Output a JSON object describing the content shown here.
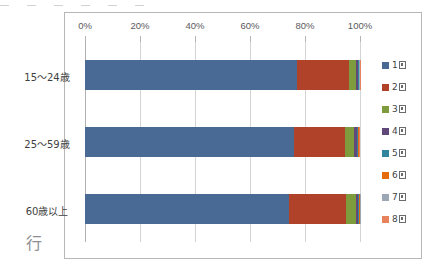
{
  "top_strip": {
    "fragments": [
      "",
      "",
      "",
      "",
      "",
      ""
    ]
  },
  "row_header_glyph": "行",
  "chart_data": {
    "type": "bar",
    "orientation": "horizontal",
    "stacked": "percent",
    "title": "",
    "xlabel": "",
    "ylabel": "",
    "xlim": [
      0,
      100
    ],
    "grid": true,
    "legend_position": "right",
    "tick_labels": [
      "0%",
      "20%",
      "40%",
      "60%",
      "80%",
      "100%"
    ],
    "tick_values": [
      0,
      20,
      40,
      60,
      80,
      100
    ],
    "categories": [
      "15〜24歳",
      "25〜59歳",
      "60歳以上"
    ],
    "series": [
      {
        "name": "1回",
        "color": "#4A6A96",
        "values": [
          77.0,
          76.0,
          74.0
        ]
      },
      {
        "name": "2回",
        "color": "#B0422A",
        "values": [
          19.0,
          18.5,
          21.0
        ]
      },
      {
        "name": "3回",
        "color": "#7E9B3E",
        "values": [
          2.6,
          3.4,
          3.4
        ]
      },
      {
        "name": "4回",
        "color": "#60497A",
        "values": [
          0.8,
          1.0,
          1.0
        ]
      },
      {
        "name": "5回",
        "color": "#31859C",
        "values": [
          0.3,
          0.4,
          0.3
        ]
      },
      {
        "name": "6回",
        "color": "#E46C0A",
        "values": [
          0.1,
          0.3,
          0.2
        ]
      },
      {
        "name": "7回",
        "color": "#9BA7B5",
        "values": [
          0.1,
          0.2,
          0.1
        ]
      },
      {
        "name": "8回",
        "color": "#E8825C",
        "values": [
          0.1,
          0.2,
          0.0
        ]
      }
    ]
  },
  "legend": {
    "items": [
      {
        "label_prefix": "1",
        "color": "#4A6A96"
      },
      {
        "label_prefix": "2",
        "color": "#B0422A"
      },
      {
        "label_prefix": "3",
        "color": "#7E9B3E"
      },
      {
        "label_prefix": "4",
        "color": "#60497A"
      },
      {
        "label_prefix": "5",
        "color": "#31859C"
      },
      {
        "label_prefix": "6",
        "color": "#E46C0A"
      },
      {
        "label_prefix": "7",
        "color": "#9BA7B5"
      },
      {
        "label_prefix": "8",
        "color": "#E8825C"
      }
    ]
  }
}
